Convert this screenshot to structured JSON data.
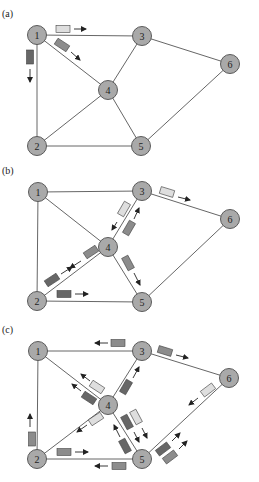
{
  "colors": {
    "light": "#dedede",
    "medium": "#8c8c8c",
    "dark": "#676767",
    "node_fill": "#a9a9a9"
  },
  "panels": [
    {
      "label": "(a)",
      "label_pos": [
        2,
        17
      ],
      "nodes": [
        {
          "id": "1",
          "x": 37,
          "y": 35
        },
        {
          "id": "2",
          "x": 37,
          "y": 146
        },
        {
          "id": "3",
          "x": 142,
          "y": 36
        },
        {
          "id": "4",
          "x": 108,
          "y": 90
        },
        {
          "id": "5",
          "x": 141,
          "y": 146
        },
        {
          "id": "6",
          "x": 230,
          "y": 64
        }
      ],
      "edges": [
        [
          "1",
          "3"
        ],
        [
          "1",
          "4"
        ],
        [
          "1",
          "2"
        ],
        [
          "3",
          "4"
        ],
        [
          "3",
          "6"
        ],
        [
          "4",
          "2"
        ],
        [
          "4",
          "5"
        ],
        [
          "2",
          "5"
        ],
        [
          "5",
          "6"
        ]
      ],
      "packets": [
        {
          "x": 63,
          "y": 29,
          "angle": 0,
          "shade": "light",
          "arrow": [
            [
              74,
              29
            ],
            [
              86,
              29
            ]
          ]
        },
        {
          "x": 62,
          "y": 45,
          "angle": 33,
          "shade": "medium",
          "arrow": [
            [
              71,
              52
            ],
            [
              80,
              60
            ]
          ]
        },
        {
          "x": 30,
          "y": 57,
          "angle": 90,
          "shade": "dark",
          "arrow": [
            [
              30,
              69
            ],
            [
              30,
              82
            ]
          ]
        }
      ]
    },
    {
      "label": "(b)",
      "label_pos": [
        2,
        174
      ],
      "nodes": [
        {
          "id": "1",
          "x": 38,
          "y": 192
        },
        {
          "id": "2",
          "x": 37,
          "y": 301
        },
        {
          "id": "3",
          "x": 142,
          "y": 191
        },
        {
          "id": "4",
          "x": 108,
          "y": 247
        },
        {
          "id": "5",
          "x": 142,
          "y": 302
        },
        {
          "id": "6",
          "x": 230,
          "y": 219
        }
      ],
      "edges": [
        [
          "1",
          "3"
        ],
        [
          "1",
          "4"
        ],
        [
          "1",
          "2"
        ],
        [
          "3",
          "4"
        ],
        [
          "3",
          "6"
        ],
        [
          "4",
          "2"
        ],
        [
          "4",
          "5"
        ],
        [
          "2",
          "5"
        ],
        [
          "5",
          "6"
        ]
      ],
      "packets": [
        {
          "x": 167,
          "y": 192,
          "angle": 17,
          "shade": "light",
          "arrow": [
            [
              178,
              197
            ],
            [
              190,
              200
            ]
          ]
        },
        {
          "x": 124,
          "y": 209,
          "angle": -60,
          "shade": "light",
          "arrow": [
            [
              117,
              222
            ],
            [
              112,
              230
            ]
          ]
        },
        {
          "x": 129,
          "y": 228,
          "angle": -60,
          "shade": "medium",
          "arrow": [
            [
              134,
              219
            ],
            [
              139,
              208
            ]
          ]
        },
        {
          "x": 91,
          "y": 252,
          "angle": -33,
          "shade": "medium",
          "arrow": [
            [
              81,
              261
            ],
            [
              70,
              268
            ]
          ]
        },
        {
          "x": 52,
          "y": 280,
          "angle": -33,
          "shade": "dark",
          "arrow": [
            [
              61,
              274
            ],
            [
              72,
              267
            ]
          ]
        },
        {
          "x": 128,
          "y": 263,
          "angle": 62,
          "shade": "medium",
          "arrow": [
            [
              134,
              273
            ],
            [
              140,
              285
            ]
          ]
        },
        {
          "x": 64,
          "y": 294,
          "angle": 0,
          "shade": "dark",
          "arrow": [
            [
              75,
              294
            ],
            [
              88,
              294
            ]
          ]
        }
      ]
    },
    {
      "label": "(c)",
      "label_pos": [
        2,
        333
      ],
      "nodes": [
        {
          "id": "1",
          "x": 38,
          "y": 351
        },
        {
          "id": "2",
          "x": 37,
          "y": 459
        },
        {
          "id": "3",
          "x": 142,
          "y": 351
        },
        {
          "id": "4",
          "x": 108,
          "y": 405
        },
        {
          "id": "5",
          "x": 142,
          "y": 459
        },
        {
          "id": "6",
          "x": 229,
          "y": 378
        }
      ],
      "edges": [
        [
          "1",
          "3"
        ],
        [
          "1",
          "4"
        ],
        [
          "1",
          "2"
        ],
        [
          "3",
          "4"
        ],
        [
          "3",
          "6"
        ],
        [
          "4",
          "2"
        ],
        [
          "4",
          "5"
        ],
        [
          "2",
          "5"
        ],
        [
          "5",
          "6"
        ]
      ],
      "packets": [
        {
          "x": 118,
          "y": 343,
          "angle": 0,
          "shade": "medium",
          "arrow": [
            [
              108,
              343
            ],
            [
              95,
              343
            ]
          ]
        },
        {
          "x": 165,
          "y": 351,
          "angle": 17,
          "shade": "medium",
          "arrow": [
            [
              176,
              355
            ],
            [
              188,
              358
            ]
          ]
        },
        {
          "x": 97,
          "y": 387,
          "angle": 33,
          "shade": "light",
          "arrow": [
            [
              90,
              381
            ],
            [
              81,
              374
            ]
          ]
        },
        {
          "x": 89,
          "y": 398,
          "angle": 33,
          "shade": "dark",
          "arrow": [
            [
              81,
              391
            ],
            [
              72,
              384
            ]
          ]
        },
        {
          "x": 126,
          "y": 387,
          "angle": -60,
          "shade": "dark",
          "arrow": [
            [
              133,
              378
            ],
            [
              139,
              367
            ]
          ]
        },
        {
          "x": 96,
          "y": 419,
          "angle": -33,
          "shade": "light",
          "arrow": [
            [
              87,
              425
            ],
            [
              77,
              432
            ]
          ]
        },
        {
          "x": 127,
          "y": 422,
          "angle": 62,
          "shade": "dark",
          "arrow": [
            [
              134,
              432
            ],
            [
              139,
              442
            ]
          ]
        },
        {
          "x": 136,
          "y": 417,
          "angle": 62,
          "shade": "light",
          "arrow": [
            [
              142,
              428
            ],
            [
              147,
              438
            ]
          ]
        },
        {
          "x": 125,
          "y": 446,
          "angle": 62,
          "shade": "dark",
          "arrow": [
            [
              120,
              437
            ],
            [
              114,
              425
            ]
          ]
        },
        {
          "x": 32,
          "y": 439,
          "angle": 90,
          "shade": "medium",
          "arrow": [
            [
              30,
              427
            ],
            [
              30,
              414
            ]
          ]
        },
        {
          "x": 64,
          "y": 452,
          "angle": 0,
          "shade": "medium",
          "arrow": [
            [
              75,
              452
            ],
            [
              88,
              452
            ]
          ]
        },
        {
          "x": 119,
          "y": 466,
          "angle": 0,
          "shade": "medium",
          "arrow": [
            [
              108,
              466
            ],
            [
              95,
              466
            ]
          ]
        },
        {
          "x": 208,
          "y": 390,
          "angle": -37,
          "shade": "light",
          "arrow": [
            [
              198,
              398
            ],
            [
              189,
              405
            ]
          ]
        },
        {
          "x": 163,
          "y": 449,
          "angle": -37,
          "shade": "dark",
          "arrow": [
            [
              172,
              441
            ],
            [
              180,
              433
            ]
          ]
        },
        {
          "x": 170,
          "y": 457,
          "angle": -37,
          "shade": "medium",
          "arrow": [
            [
              179,
              449
            ],
            [
              187,
              441
            ]
          ]
        }
      ]
    }
  ]
}
